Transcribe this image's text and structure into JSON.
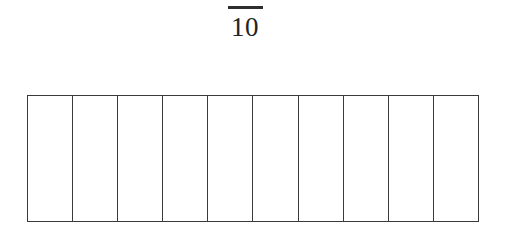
{
  "figure": {
    "kind": "fraction-bar-model",
    "background_color": "#ffffff",
    "line_color": "#3a3a3a",
    "text_color": "#232323"
  },
  "label": {
    "denominator": "10",
    "has_fraction_bar": true,
    "numerator": ""
  },
  "bar_model": {
    "total_parts": 10,
    "shaded_parts": 0,
    "cells": [
      {
        "index": "1",
        "shaded": false
      },
      {
        "index": "2",
        "shaded": false
      },
      {
        "index": "3",
        "shaded": false
      },
      {
        "index": "4",
        "shaded": false
      },
      {
        "index": "5",
        "shaded": false
      },
      {
        "index": "6",
        "shaded": false
      },
      {
        "index": "7",
        "shaded": false
      },
      {
        "index": "8",
        "shaded": false
      },
      {
        "index": "9",
        "shaded": false
      },
      {
        "index": "10",
        "shaded": false
      }
    ]
  },
  "chart_data": {
    "type": "bar",
    "title": "",
    "xlabel": "",
    "ylabel": "",
    "categories": [
      "1",
      "2",
      "3",
      "4",
      "5",
      "6",
      "7",
      "8",
      "9",
      "10"
    ],
    "values": [
      0,
      0,
      0,
      0,
      0,
      0,
      0,
      0,
      0,
      0
    ],
    "annotations": [
      "10"
    ],
    "grid": false,
    "legend_position": "none"
  }
}
